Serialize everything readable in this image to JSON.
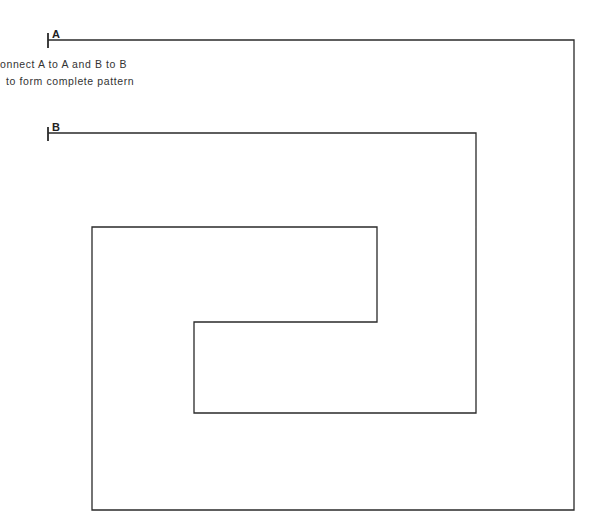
{
  "diagram": {
    "instructions": [
      "onnect A to A and B to B",
      "to form complete pattern"
    ],
    "labels": {
      "a": "A",
      "b": "B"
    },
    "stroke_color": "#2a2a2a",
    "paths": {
      "line_a": [
        [
          48,
          40
        ],
        [
          574,
          40
        ],
        [
          574,
          510
        ],
        [
          92,
          510
        ],
        [
          92,
          227
        ],
        [
          377,
          227
        ],
        [
          377,
          322
        ],
        [
          194,
          322
        ],
        [
          194,
          413
        ],
        [
          476,
          413
        ],
        [
          476,
          133
        ],
        [
          48,
          133
        ]
      ]
    }
  }
}
